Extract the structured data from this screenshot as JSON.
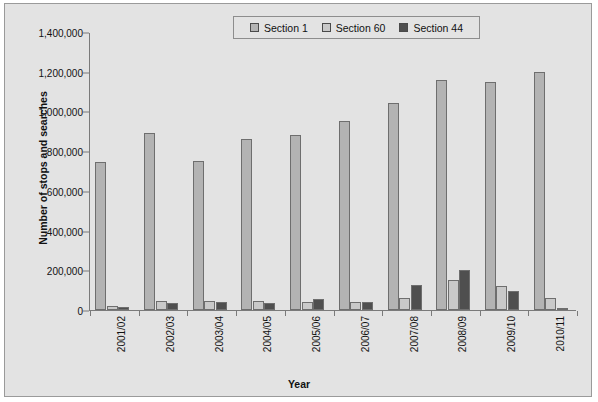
{
  "chart_data": {
    "type": "bar",
    "title": "",
    "xlabel": "Year",
    "ylabel": "Number of stops and searches",
    "ylim": [
      0,
      1400000
    ],
    "yticks": [
      "0",
      "200,000",
      "400,000",
      "600,000",
      "800,000",
      "1,000,000",
      "1,200,000",
      "1,400,000"
    ],
    "ytick_values": [
      0,
      200000,
      400000,
      600000,
      800000,
      1000000,
      1200000,
      1400000
    ],
    "grid": false,
    "legend_position": "top-center",
    "categories": [
      "2001/02",
      "2002/03",
      "2003/04",
      "2004/05",
      "2005/06",
      "2006/07",
      "2007/08",
      "2008/09",
      "2009/10",
      "2010/11"
    ],
    "series": [
      {
        "name": "Section 1",
        "color": "#b3b3b3",
        "values": [
          745000,
          890000,
          750000,
          860000,
          880000,
          950000,
          1045000,
          1160000,
          1150000,
          1200000
        ]
      },
      {
        "name": "Section 60",
        "color": "#c9c9c9",
        "values": [
          20000,
          45000,
          45000,
          45000,
          40000,
          40000,
          60000,
          150000,
          120000,
          60000
        ]
      },
      {
        "name": "Section 44",
        "color": "#4f4f4f",
        "values": [
          15000,
          35000,
          40000,
          35000,
          55000,
          40000,
          125000,
          200000,
          95000,
          1000
        ]
      }
    ]
  },
  "legend": {
    "items": [
      {
        "label": "Section 1",
        "color": "#b3b3b3"
      },
      {
        "label": "Section 60",
        "color": "#c9c9c9"
      },
      {
        "label": "Section 44",
        "color": "#4f4f4f"
      }
    ]
  }
}
